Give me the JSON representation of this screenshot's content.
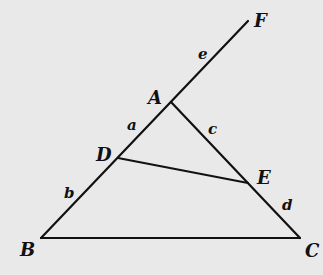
{
  "diagram": {
    "type": "geometry-triangle",
    "background": "#e9e9e9",
    "stroke_color": "#111111",
    "points": {
      "A": {
        "label": "A",
        "x": 171,
        "y": 102,
        "label_x": 148,
        "label_y": 104
      },
      "B": {
        "label": "B",
        "x": 41,
        "y": 238,
        "label_x": 20,
        "label_y": 256
      },
      "C": {
        "label": "C",
        "x": 300,
        "y": 238,
        "label_x": 307,
        "label_y": 256
      },
      "D": {
        "label": "D",
        "x": 118,
        "y": 158,
        "label_x": 96,
        "label_y": 161
      },
      "E": {
        "label": "E",
        "x": 248,
        "y": 183,
        "label_x": 258,
        "label_y": 183
      },
      "F": {
        "label": "F",
        "x": 248,
        "y": 21,
        "label_x": 254,
        "label_y": 27
      }
    },
    "segments": [
      {
        "from": "B",
        "to": "F",
        "name": "line-BF"
      },
      {
        "from": "A",
        "to": "C",
        "name": "side-AC"
      },
      {
        "from": "B",
        "to": "C",
        "name": "side-BC"
      },
      {
        "from": "D",
        "to": "E",
        "name": "segment-DE"
      }
    ],
    "segment_labels": [
      {
        "text": "a",
        "x": 128,
        "y": 130,
        "of": "AD"
      },
      {
        "text": "b",
        "x": 64,
        "y": 198,
        "of": "DB"
      },
      {
        "text": "c",
        "x": 209,
        "y": 134,
        "of": "AE"
      },
      {
        "text": "d",
        "x": 283,
        "y": 210,
        "of": "EC"
      },
      {
        "text": "e",
        "x": 199,
        "y": 59,
        "of": "AF"
      }
    ]
  }
}
